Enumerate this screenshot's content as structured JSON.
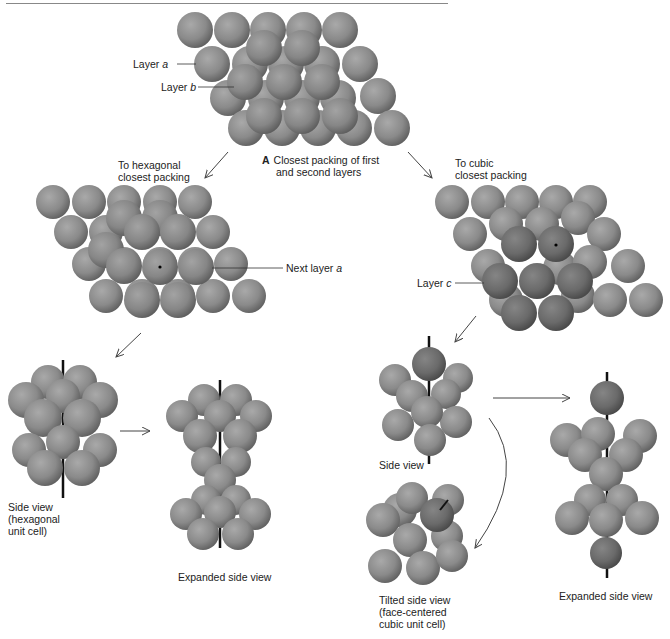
{
  "title_section": {
    "label_letter": "A",
    "caption_line1": "Closest packing of first",
    "caption_line2": "and second layers"
  },
  "labels": {
    "layer_a_prefix": "Layer ",
    "layer_a_var": "a",
    "layer_b_prefix": "Layer ",
    "layer_b_var": "b",
    "layer_c_prefix": "Layer ",
    "layer_c_var": "c",
    "next_layer_prefix": "Next layer ",
    "next_layer_var": "a"
  },
  "branches": {
    "hexagonal": {
      "heading_line1": "To hexagonal",
      "heading_line2": "closest packing",
      "side_view_line1": "Side view",
      "side_view_line2": "(hexagonal",
      "side_view_line3": "unit cell)",
      "expanded": "Expanded side view"
    },
    "cubic": {
      "heading_line1": "To cubic",
      "heading_line2": "closest packing",
      "side_view": "Side view",
      "tilted_line1": "Tilted side view",
      "tilted_line2": "(face-centered",
      "tilted_line3": "cubic unit cell)",
      "expanded": "Expanded side view"
    }
  },
  "colors": {
    "sphere_light": "#8a8a8a",
    "sphere_dark": "#6b6b6b",
    "text": "#222222",
    "arrow": "#444444"
  }
}
